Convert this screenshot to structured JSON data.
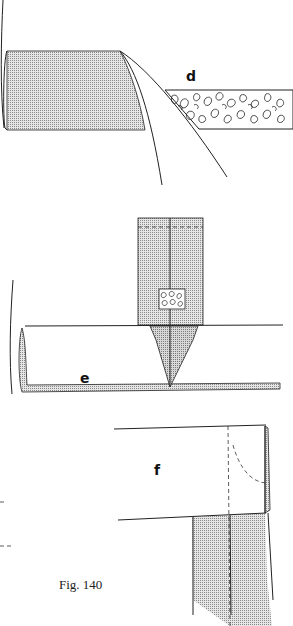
{
  "figure": {
    "caption": "Fig. 140",
    "panels": [
      {
        "id": "d",
        "label": "d",
        "description": "Fabric edge folded under at angle, beside a strip of padding/interfacing with textured fill"
      },
      {
        "id": "e",
        "label": "e",
        "description": "Vertical shaded strip with textured patch meeting a horizontal rolled edge, ending in a pointed tip"
      },
      {
        "id": "f",
        "label": "f",
        "description": "Horizontal panel with dashed stitch lines and curved dashed corner over a shaded vertical strip"
      }
    ]
  },
  "colors": {
    "ink": "#222222",
    "shade": "#bdbdbd",
    "background": "#ffffff"
  }
}
